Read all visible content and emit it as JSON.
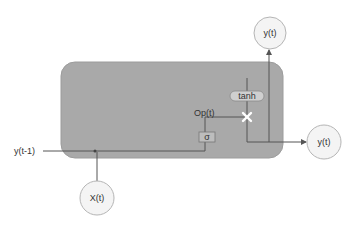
{
  "diagram": {
    "colors": {
      "background": "#ffffff",
      "cell_fill": "#a8a8a8",
      "cell_stroke": "#9a9a9a",
      "line": "#555555",
      "node_fill": "#f4f4f4",
      "node_stroke": "#b0b0b0",
      "tanh_fill": "#c8c8c8",
      "sigma_fill": "#bdbdbd",
      "multiply_color": "#ffffff"
    },
    "inputs": {
      "prev_output": "y(t-1)",
      "input": "X(t)"
    },
    "gate": {
      "sigma_label": "σ",
      "gate_output_label": "Op(t)",
      "tanh_label": "tanh",
      "multiply_symbol": "✕"
    },
    "outputs": {
      "output_top": "y(t)",
      "output_right": "y(t)"
    }
  }
}
